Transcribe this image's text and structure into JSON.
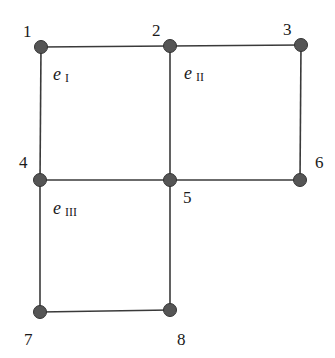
{
  "diagram": {
    "type": "finite-element-mesh",
    "colors": {
      "edge": "#3a3a3a",
      "node_fill": "#555555",
      "node_stroke": "#333333",
      "text": "#1a1a1a",
      "background": "#ffffff"
    },
    "nodes": [
      {
        "id": "1",
        "label": "1",
        "x": 41,
        "y": 47,
        "lx": 23,
        "ly": 37
      },
      {
        "id": "2",
        "label": "2",
        "x": 170,
        "y": 46,
        "lx": 152,
        "ly": 36
      },
      {
        "id": "3",
        "label": "3",
        "x": 301,
        "y": 45,
        "lx": 283,
        "ly": 35
      },
      {
        "id": "4",
        "label": "4",
        "x": 40,
        "y": 180,
        "lx": 19,
        "ly": 168
      },
      {
        "id": "5",
        "label": "5",
        "x": 170,
        "y": 180,
        "lx": 183,
        "ly": 203
      },
      {
        "id": "6",
        "label": "6",
        "x": 300,
        "y": 180,
        "lx": 315,
        "ly": 168
      },
      {
        "id": "7",
        "label": "7",
        "x": 40,
        "y": 312,
        "lx": 24,
        "ly": 345
      },
      {
        "id": "8",
        "label": "8",
        "x": 170,
        "y": 310,
        "lx": 177,
        "ly": 345
      }
    ],
    "edges": [
      [
        "1",
        "2"
      ],
      [
        "2",
        "3"
      ],
      [
        "3",
        "6"
      ],
      [
        "1",
        "4"
      ],
      [
        "2",
        "5"
      ],
      [
        "4",
        "5"
      ],
      [
        "5",
        "6"
      ],
      [
        "4",
        "7"
      ],
      [
        "5",
        "8"
      ],
      [
        "7",
        "8"
      ]
    ],
    "elements": [
      {
        "id": "I",
        "base": "e",
        "sub": "I",
        "x": 53,
        "y": 80
      },
      {
        "id": "II",
        "base": "e",
        "sub": "II",
        "x": 184,
        "y": 79
      },
      {
        "id": "III",
        "base": "e",
        "sub": "III",
        "x": 53,
        "y": 214
      }
    ]
  }
}
